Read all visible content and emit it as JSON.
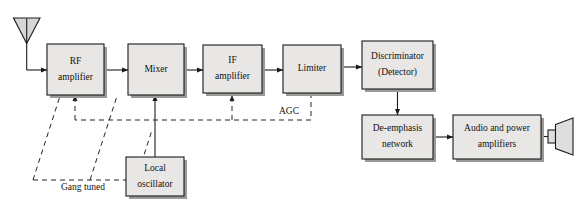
{
  "diagram": {
    "colors": {
      "block_fill": "#e8e7e5",
      "block_stroke": "#1a1a1a",
      "shadow": "#9a9a98",
      "dashed_line": "#262626",
      "background": "#ffffff"
    },
    "blocks": [
      {
        "id": "rf_amplifier",
        "line1": "RF",
        "line2": "amplifier",
        "x": 47,
        "y": 44,
        "w": 57,
        "h": 51
      },
      {
        "id": "mixer",
        "line1": "Mixer",
        "line2": "",
        "x": 128,
        "y": 44,
        "w": 56,
        "h": 51
      },
      {
        "id": "if_amplifier",
        "line1": "IF",
        "line2": "amplifier",
        "x": 203,
        "y": 45,
        "w": 59,
        "h": 48
      },
      {
        "id": "limiter",
        "line1": "Limiter",
        "line2": "",
        "x": 283,
        "y": 45,
        "w": 58,
        "h": 48
      },
      {
        "id": "discriminator",
        "line1": "Discriminator",
        "line2": "(Detector)",
        "x": 362,
        "y": 41,
        "w": 71,
        "h": 48
      },
      {
        "id": "de_emphasis",
        "line1": "De-emphasis",
        "line2": "network",
        "x": 362,
        "y": 115,
        "w": 71,
        "h": 44
      },
      {
        "id": "audio_power",
        "line1": "Audio and power",
        "line2": "amplifiers",
        "x": 453,
        "y": 115,
        "w": 88,
        "h": 44
      },
      {
        "id": "local_oscillator",
        "line1": "Local",
        "line2": "oscillator",
        "x": 126,
        "y": 157,
        "w": 58,
        "h": 39
      }
    ],
    "free_labels": [
      {
        "id": "agc_label",
        "text": "AGC",
        "x": 289,
        "y": 112
      },
      {
        "id": "gang_tuned_label",
        "text": "Gang tuned",
        "x": 83,
        "y": 186
      }
    ],
    "icons": [
      {
        "id": "antenna",
        "name": "antenna-icon"
      },
      {
        "id": "speaker",
        "name": "speaker-icon"
      }
    ],
    "signal_paths": [
      {
        "id": "antenna-to-rf",
        "type": "solid",
        "from": "antenna",
        "to": "rf_amplifier"
      },
      {
        "id": "rf-to-mixer",
        "type": "solid",
        "from": "rf_amplifier",
        "to": "mixer"
      },
      {
        "id": "mixer-to-if",
        "type": "solid",
        "from": "mixer",
        "to": "if_amplifier"
      },
      {
        "id": "if-to-limiter",
        "type": "solid",
        "from": "if_amplifier",
        "to": "limiter"
      },
      {
        "id": "limiter-to-discriminator",
        "type": "solid",
        "from": "limiter",
        "to": "discriminator"
      },
      {
        "id": "discriminator-to-deemph",
        "type": "solid",
        "from": "discriminator",
        "to": "de_emphasis"
      },
      {
        "id": "deemph-to-audio",
        "type": "solid",
        "from": "de_emphasis",
        "to": "audio_power"
      },
      {
        "id": "audio-to-speaker",
        "type": "solid",
        "from": "audio_power",
        "to": "speaker"
      },
      {
        "id": "lo-to-mixer",
        "type": "solid",
        "from": "local_oscillator",
        "to": "mixer"
      },
      {
        "id": "agc-bus",
        "type": "dashed",
        "from": "limiter",
        "to": "if_amplifier, rf_amplifier"
      },
      {
        "id": "gang-tuned-rf",
        "type": "dashed",
        "from": "gang_tuned_label",
        "to": "rf_amplifier"
      },
      {
        "id": "gang-tuned-mixer",
        "type": "dashed",
        "from": "gang_tuned_label",
        "to": "mixer"
      },
      {
        "id": "gang-tuned-lo",
        "type": "dashed",
        "from": "gang_tuned_label",
        "to": "local_oscillator"
      }
    ]
  }
}
